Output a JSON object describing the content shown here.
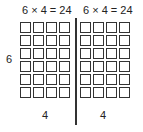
{
  "diagram": {
    "left_equation": "6 × 4 = 24",
    "right_equation": "6 × 4 = 24",
    "row_label": "6",
    "left_column_label": "4",
    "right_column_label": "4",
    "rows": 6,
    "columns_per_group": 4,
    "groups": 2,
    "stroke_color": "#333333"
  }
}
